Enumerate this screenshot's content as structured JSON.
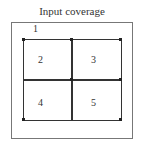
{
  "diagram": {
    "title": "Input coverage",
    "regions": [
      {
        "id": "1",
        "label": "1"
      },
      {
        "id": "2",
        "label": "2"
      },
      {
        "id": "3",
        "label": "3"
      },
      {
        "id": "4",
        "label": "4"
      },
      {
        "id": "5",
        "label": "5"
      }
    ]
  }
}
